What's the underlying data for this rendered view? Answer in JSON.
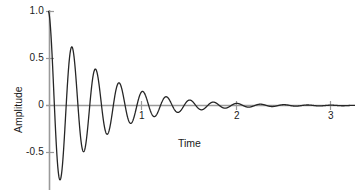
{
  "chart_data": {
    "type": "line",
    "title": "",
    "xlabel": "Time",
    "ylabel": "Amplitude",
    "xlim": [
      0,
      3.25
    ],
    "ylim": [
      -0.88,
      1.0
    ],
    "xticks": [
      1,
      2,
      3
    ],
    "xtick_labels": [
      "1",
      "2",
      "3"
    ],
    "yticks": [
      1.0,
      0.5,
      0,
      -0.5
    ],
    "ytick_labels": [
      "1.0",
      "0.5",
      "0",
      "-0.5"
    ],
    "grid": false,
    "legend": null,
    "series": [
      {
        "name": "damped oscillation",
        "description": "y = exp(-1.9 t) * cos(2 pi * 4 t)",
        "color": "#262626",
        "amplitude": 1.0,
        "decay_rate": 1.9,
        "frequency_hz": 4.0,
        "extrema": [
          {
            "t": 0.0,
            "y": 1.0
          },
          {
            "t": 0.125,
            "y": -0.79
          },
          {
            "t": 0.25,
            "y": 0.53
          },
          {
            "t": 0.375,
            "y": -0.42
          },
          {
            "t": 0.5,
            "y": 0.3
          },
          {
            "t": 0.625,
            "y": -0.22
          },
          {
            "t": 0.75,
            "y": 0.16
          },
          {
            "t": 0.875,
            "y": -0.12
          },
          {
            "t": 1.0,
            "y": 0.09
          },
          {
            "t": 1.125,
            "y": -0.07
          },
          {
            "t": 1.25,
            "y": 0.05
          },
          {
            "t": 1.375,
            "y": -0.04
          },
          {
            "t": 1.5,
            "y": 0.03
          },
          {
            "t": 1.625,
            "y": -0.02
          },
          {
            "t": 1.75,
            "y": 0.015
          },
          {
            "t": 2.0,
            "y": 0.008
          },
          {
            "t": 2.5,
            "y": 0.002
          },
          {
            "t": 3.0,
            "y": 0.0
          }
        ]
      }
    ],
    "axis_color": "#808080",
    "curve_color": "#262626",
    "text_color": "#1a1a1a"
  },
  "axes": {
    "y_title": "Amplitude",
    "x_title": "Time",
    "y_tick_1": "1.0",
    "y_tick_2": "0.5",
    "y_tick_3": "0",
    "y_tick_4": "-0.5",
    "x_tick_1": "1",
    "x_tick_2": "2",
    "x_tick_3": "3"
  }
}
